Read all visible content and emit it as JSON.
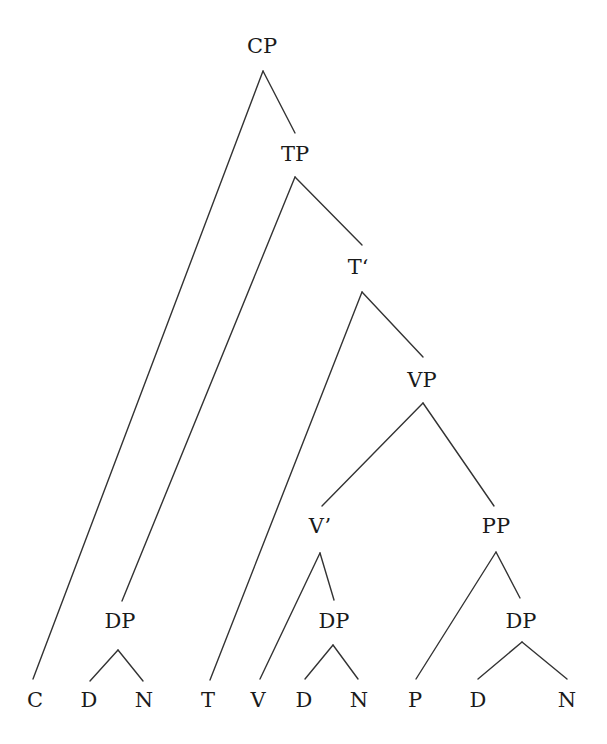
{
  "diagram": {
    "type": "syntax-tree",
    "colors": {
      "background": "#ffffff",
      "line": "#333333",
      "text": "#1a1a1a"
    },
    "nodes": [
      {
        "id": "CP",
        "label": "CP",
        "x": 262,
        "y": 47,
        "kind": "phrase"
      },
      {
        "id": "TP",
        "label": "TP",
        "x": 295,
        "y": 155,
        "kind": "phrase"
      },
      {
        "id": "Tbar",
        "label": "T‘",
        "x": 358,
        "y": 268,
        "kind": "bar"
      },
      {
        "id": "VP",
        "label": "VP",
        "x": 422,
        "y": 381,
        "kind": "phrase"
      },
      {
        "id": "Vbar",
        "label": "V’",
        "x": 320,
        "y": 527,
        "kind": "bar"
      },
      {
        "id": "PP",
        "label": "PP",
        "x": 496,
        "y": 527,
        "kind": "phrase"
      },
      {
        "id": "DP1",
        "label": "DP",
        "x": 120,
        "y": 622,
        "kind": "phrase"
      },
      {
        "id": "DP2",
        "label": "DP",
        "x": 334,
        "y": 622,
        "kind": "phrase"
      },
      {
        "id": "DP3",
        "label": "DP",
        "x": 521,
        "y": 622,
        "kind": "phrase"
      },
      {
        "id": "C",
        "label": "C",
        "x": 35,
        "y": 701,
        "kind": "leaf"
      },
      {
        "id": "D1",
        "label": "D",
        "x": 89,
        "y": 701,
        "kind": "leaf"
      },
      {
        "id": "N1",
        "label": "N",
        "x": 144,
        "y": 701,
        "kind": "leaf"
      },
      {
        "id": "T",
        "label": "T",
        "x": 208,
        "y": 701,
        "kind": "leaf"
      },
      {
        "id": "V",
        "label": "V",
        "x": 258,
        "y": 701,
        "kind": "leaf"
      },
      {
        "id": "D2",
        "label": "D",
        "x": 304,
        "y": 701,
        "kind": "leaf"
      },
      {
        "id": "N2",
        "label": "N",
        "x": 359,
        "y": 701,
        "kind": "leaf"
      },
      {
        "id": "P",
        "label": "P",
        "x": 415,
        "y": 701,
        "kind": "leaf"
      },
      {
        "id": "D3",
        "label": "D",
        "x": 478,
        "y": 701,
        "kind": "leaf"
      },
      {
        "id": "N3",
        "label": "N",
        "x": 567,
        "y": 701,
        "kind": "leaf"
      }
    ],
    "edges": [
      {
        "from": "CP",
        "to": "C",
        "x1": 263,
        "y1": 71,
        "x2": 33,
        "y2": 679
      },
      {
        "from": "CP",
        "to": "TP",
        "x1": 263,
        "y1": 71,
        "x2": 295,
        "y2": 133
      },
      {
        "from": "TP",
        "to": "DP1",
        "x1": 295,
        "y1": 177,
        "x2": 122,
        "y2": 601
      },
      {
        "from": "TP",
        "to": "Tbar",
        "x1": 295,
        "y1": 177,
        "x2": 362,
        "y2": 245
      },
      {
        "from": "Tbar",
        "to": "T",
        "x1": 362,
        "y1": 292,
        "x2": 210,
        "y2": 680
      },
      {
        "from": "Tbar",
        "to": "VP",
        "x1": 362,
        "y1": 292,
        "x2": 423,
        "y2": 357
      },
      {
        "from": "VP",
        "to": "Vbar",
        "x1": 423,
        "y1": 403,
        "x2": 322,
        "y2": 506
      },
      {
        "from": "VP",
        "to": "PP",
        "x1": 423,
        "y1": 403,
        "x2": 494,
        "y2": 506
      },
      {
        "from": "Vbar",
        "to": "V",
        "x1": 320,
        "y1": 553,
        "x2": 260,
        "y2": 679
      },
      {
        "from": "Vbar",
        "to": "DP2",
        "x1": 320,
        "y1": 553,
        "x2": 334,
        "y2": 600
      },
      {
        "from": "PP",
        "to": "P",
        "x1": 496,
        "y1": 552,
        "x2": 416,
        "y2": 679
      },
      {
        "from": "PP",
        "to": "DP3",
        "x1": 496,
        "y1": 552,
        "x2": 520,
        "y2": 598
      },
      {
        "from": "DP1",
        "to": "D1",
        "x1": 118,
        "y1": 650,
        "x2": 90,
        "y2": 681
      },
      {
        "from": "DP1",
        "to": "N1",
        "x1": 118,
        "y1": 650,
        "x2": 143,
        "y2": 681
      },
      {
        "from": "DP2",
        "to": "D2",
        "x1": 333,
        "y1": 645,
        "x2": 305,
        "y2": 679
      },
      {
        "from": "DP2",
        "to": "N2",
        "x1": 333,
        "y1": 645,
        "x2": 358,
        "y2": 679
      },
      {
        "from": "DP3",
        "to": "D3",
        "x1": 522,
        "y1": 642,
        "x2": 478,
        "y2": 679
      },
      {
        "from": "DP3",
        "to": "N3",
        "x1": 522,
        "y1": 642,
        "x2": 567,
        "y2": 679
      }
    ]
  }
}
